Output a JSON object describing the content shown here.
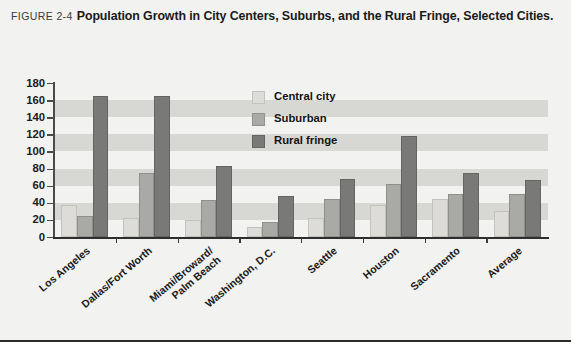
{
  "figure": {
    "number_label": "FIGURE 2-4",
    "title": "Population Growth in City Centers, Suburbs, and the Rural Fringe, Selected Cities."
  },
  "legend": {
    "position": "inside-top-center",
    "items": [
      {
        "label": "Central city",
        "color": "#dddcd8",
        "swatch_name": "legend-swatch-central-city"
      },
      {
        "label": "Suburban",
        "color": "#a9a9a5",
        "swatch_name": "legend-swatch-suburban"
      },
      {
        "label": "Rural fringe",
        "color": "#797977",
        "swatch_name": "legend-swatch-rural-fringe"
      }
    ]
  },
  "chart_data": {
    "type": "bar",
    "title": "Population Growth in City Centers, Suburbs, and the Rural Fringe, Selected Cities.",
    "xlabel": "",
    "ylabel": "Percent population growth",
    "ylim": [
      0,
      180
    ],
    "yticks": [
      0,
      20,
      40,
      60,
      80,
      100,
      120,
      140,
      160,
      180
    ],
    "grid": "horizontal-alternating-bands",
    "categories": [
      "Los Angeles",
      "Dallas/Fort Worth",
      "Miami/Broward/\nPalm Beach",
      "Washington, D.C.",
      "Seattle",
      "Houston",
      "Sacramento",
      "Average"
    ],
    "series": [
      {
        "name": "Central city",
        "color": "#dddcd8",
        "values": [
          38,
          22,
          20,
          12,
          22,
          37,
          45,
          30
        ]
      },
      {
        "name": "Suburban",
        "color": "#a9a9a5",
        "values": [
          25,
          75,
          43,
          17,
          45,
          62,
          50,
          50
        ]
      },
      {
        "name": "Rural fringe",
        "color": "#797977",
        "values": [
          165,
          165,
          83,
          48,
          68,
          118,
          75,
          67
        ]
      }
    ]
  }
}
